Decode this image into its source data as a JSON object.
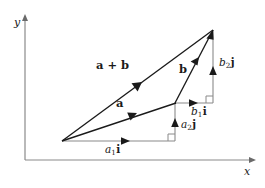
{
  "figure": {
    "type": "vector-addition-diagram",
    "background_color": "#ffffff",
    "stroke_color": "#1a1a1a",
    "axis_color": "#808080",
    "axes": {
      "x_label": "x",
      "y_label": "y",
      "origin_px": [
        25,
        160
      ],
      "x_end_px": [
        256,
        160
      ],
      "y_end_px": [
        25,
        14
      ]
    },
    "points": {
      "origin_label": "O",
      "tail_px": [
        62,
        141
      ],
      "a_tip_px": [
        175,
        103
      ],
      "sum_tip_px": [
        213,
        30
      ],
      "corner_lower_px": [
        175,
        141
      ],
      "corner_upper_px": [
        213,
        103
      ]
    },
    "vectors": [
      {
        "name": "a-plus-b",
        "label": "a + b",
        "label_plain": "a + b",
        "from_px": [
          62,
          141
        ],
        "to_px": [
          213,
          30
        ],
        "label_px": [
          96,
          65
        ],
        "arrowhead_at": 0.52
      },
      {
        "name": "a",
        "label": "a",
        "label_plain": "a",
        "from_px": [
          62,
          141
        ],
        "to_px": [
          175,
          103
        ],
        "label_px": [
          116,
          103
        ],
        "arrowhead_at": 0.62
      },
      {
        "name": "b",
        "label": "b",
        "label_plain": "b",
        "from_px": [
          62,
          141
        ],
        "to_px": [
          213,
          30
        ],
        "label_px": [
          179,
          69
        ],
        "arrowhead_at": 1.0
      }
    ],
    "components": [
      {
        "name": "a1i",
        "scalar": "a",
        "subscript": "1",
        "unit": "i",
        "label_plain": "a₁i",
        "from_px": [
          62,
          141
        ],
        "to_px": [
          175,
          141
        ],
        "direction": "horizontal",
        "label_px": [
          105,
          148
        ]
      },
      {
        "name": "a2j",
        "scalar": "a",
        "subscript": "2",
        "unit": "j",
        "label_plain": "a₂j",
        "from_px": [
          175,
          141
        ],
        "to_px": [
          175,
          103
        ],
        "direction": "vertical",
        "label_px": [
          181,
          124
        ]
      },
      {
        "name": "b1i",
        "scalar": "b",
        "subscript": "1",
        "unit": "i",
        "label_plain": "b₁i",
        "from_px": [
          175,
          103
        ],
        "to_px": [
          213,
          103
        ],
        "direction": "horizontal",
        "label_px": [
          191,
          110
        ]
      },
      {
        "name": "b2j",
        "scalar": "b",
        "subscript": "2",
        "unit": "j",
        "label_plain": "b₂j",
        "from_px": [
          213,
          103
        ],
        "to_px": [
          213,
          30
        ],
        "direction": "vertical",
        "label_px": [
          219,
          62
        ]
      }
    ],
    "right_angle_markers": [
      {
        "name": "lower-right-angle",
        "corner_px": [
          175,
          141
        ],
        "size_px": 7
      },
      {
        "name": "upper-right-angle",
        "corner_px": [
          213,
          103
        ],
        "size_px": 7
      }
    ]
  }
}
